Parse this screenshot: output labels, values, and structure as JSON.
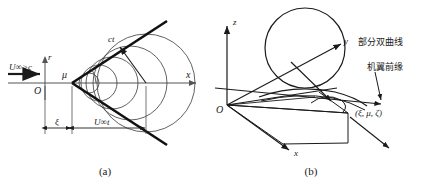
{
  "figure": {
    "background_color": "#ffffff",
    "line_color": "#1a1a1a",
    "thin_line_color": "#3a3a3a",
    "axis_color": "#555555"
  },
  "panel_a": {
    "caption": "(a)",
    "labels": {
      "flow": "U∞>c",
      "origin": "O",
      "axis_x": "x",
      "axis_r": "r",
      "mach_angle": "μ",
      "wave_radius": "ct",
      "dim_xi": "ξ",
      "dim_ut": "U∞t"
    },
    "geometry": {
      "apex": [
        72,
        83
      ],
      "origin": [
        45,
        83
      ],
      "cone_half_angle_deg": 33,
      "wave_circles": [
        {
          "cx": 89,
          "cy": 83,
          "r": 10
        },
        {
          "cx": 99,
          "cy": 83,
          "r": 18
        },
        {
          "cx": 112,
          "cy": 83,
          "r": 26
        },
        {
          "cx": 130,
          "cy": 83,
          "r": 37
        },
        {
          "cx": 146,
          "cy": 83,
          "r": 49
        }
      ],
      "radius_arrow_from": [
        146,
        83
      ],
      "radius_arrow_to": [
        118,
        44
      ]
    }
  },
  "panel_b": {
    "caption": "(b)",
    "labels": {
      "origin": "O",
      "axis_x": "x",
      "axis_y": "y",
      "axis_z": "z",
      "hyperbola": "部分双曲线",
      "leading_edge": "机翼前缘",
      "point_coords": "(ξ, μ, ζ)"
    },
    "geometry": {
      "origin": [
        12,
        105
      ],
      "sphere": {
        "cx": 90,
        "cy": 48,
        "r": 40
      },
      "point_xyz": [
        133,
        113
      ],
      "axis_z_tip": [
        12,
        22
      ],
      "axis_y_tip": [
        128,
        43
      ],
      "axis_x_tip": [
        72,
        152
      ]
    }
  }
}
